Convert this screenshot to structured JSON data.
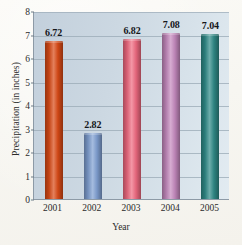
{
  "chart_data": {
    "type": "bar",
    "title": "",
    "categories": [
      "2001",
      "2002",
      "2003",
      "2004",
      "2005"
    ],
    "values": [
      6.72,
      2.82,
      6.82,
      7.08,
      7.04
    ],
    "value_labels": [
      "6.72",
      "2.82",
      "6.82",
      "7.08",
      "7.04"
    ],
    "xlabel": "Year",
    "ylabel": "Precipitation (in inches)",
    "ylim": [
      0,
      8
    ],
    "yticks": [
      0,
      1,
      2,
      3,
      4,
      5,
      6,
      7,
      8
    ],
    "ytick_labels": [
      "0",
      "1",
      "2",
      "3",
      "4",
      "5",
      "6",
      "7",
      "8"
    ],
    "grid": "horizontal",
    "legend": "none",
    "bar_colors": [
      "#d94a16",
      "#7f9fd1",
      "#ef6a80",
      "#c489bd",
      "#2f8a87"
    ],
    "plot_background": "#ccd8e2",
    "page_background": "#faf9f5"
  }
}
